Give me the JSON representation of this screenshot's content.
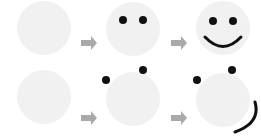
{
  "colors": {
    "background": "#ffffff",
    "face": "#f1f1f1",
    "feature": "#111111",
    "arrow": "#a9a9a9"
  },
  "rows": [
    {
      "name": "correct-assembly",
      "stages": [
        {
          "label": "blank face"
        },
        {
          "label": "face with eyes"
        },
        {
          "label": "smiling face"
        }
      ]
    },
    {
      "name": "misplaced-assembly",
      "stages": [
        {
          "label": "blank face"
        },
        {
          "label": "face with misplaced eyes"
        },
        {
          "label": "face with misplaced eyes and mouth"
        }
      ]
    }
  ]
}
